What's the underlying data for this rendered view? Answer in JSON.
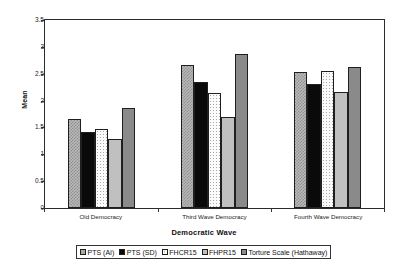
{
  "chart_data": {
    "type": "bar",
    "title": "",
    "xlabel": "Democratic Wave",
    "ylabel": "Mean",
    "ylim": [
      0,
      3.5
    ],
    "ytick_labels": [
      "3.5",
      "3",
      "2.5",
      "2",
      "1.5",
      "1",
      "0.5",
      "0"
    ],
    "ytick_values": [
      3.5,
      3,
      2.5,
      2,
      1.5,
      1,
      0.5,
      0
    ],
    "grid": false,
    "legend_position": "bottom",
    "categories": [
      "Old Democracy",
      "Third Wave Democracy",
      "Fourth Wave Democracy"
    ],
    "series": [
      {
        "name": "PTS (AI)",
        "values": [
          1.65,
          2.66,
          2.53
        ],
        "fill": "checker-gray",
        "color": "#b9b9b9"
      },
      {
        "name": "PTS (SD)",
        "values": [
          1.42,
          2.35,
          2.3
        ],
        "fill": "solid-black",
        "color": "#0a0a0a"
      },
      {
        "name": "FHCR15",
        "values": [
          1.48,
          2.15,
          2.55
        ],
        "fill": "dots-white",
        "color": "#fbfbfb"
      },
      {
        "name": "FHPR15",
        "values": [
          1.28,
          1.7,
          2.16
        ],
        "fill": "solid-light-gray",
        "color": "#c0c0c0"
      },
      {
        "name": "Torture Scale (Hathaway)",
        "values": [
          1.86,
          2.87,
          2.63
        ],
        "fill": "solid-medium-gray",
        "color": "#8a8a8a"
      }
    ]
  },
  "axis": {
    "y_title": "Mean",
    "x_title": "Democratic Wave"
  }
}
